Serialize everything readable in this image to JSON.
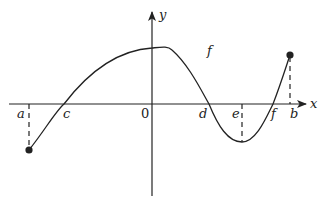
{
  "diagram": {
    "type": "function-graph",
    "curve_label": "f",
    "axes": {
      "x_label": "x",
      "y_label": "y",
      "origin_label": "0"
    },
    "x_markers": [
      {
        "id": "a",
        "label": "a",
        "note": "left endpoint of interval, f(a) < 0, closed dot"
      },
      {
        "id": "c",
        "label": "c",
        "note": "zero of f"
      },
      {
        "id": "d",
        "label": "d",
        "note": "zero of f"
      },
      {
        "id": "e",
        "label": "e",
        "note": "local minimum of f"
      },
      {
        "id": "f",
        "label": "f",
        "note": "zero of f"
      },
      {
        "id": "b",
        "label": "b",
        "note": "right endpoint of interval, f(b) > 0, closed dot"
      }
    ],
    "features": {
      "local_maximum": "near x = 0 (slightly right of y-axis)",
      "local_minimum": "at x = e",
      "endpoints": [
        "a",
        "b"
      ]
    },
    "colors": {
      "stroke": "#222222",
      "background": "#ffffff"
    }
  }
}
